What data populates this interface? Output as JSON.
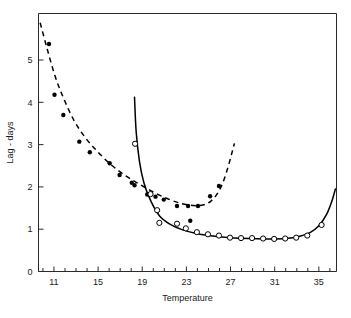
{
  "chart_data": {
    "type": "scatter",
    "title": "",
    "xlabel": "Temperature",
    "ylabel": "Lag - days",
    "xlim": [
      9.6,
      36.6
    ],
    "ylim": [
      0,
      6.1
    ],
    "grid": false,
    "legend": "none",
    "x_ticks_major": [
      11,
      15,
      19,
      23,
      27,
      31,
      35
    ],
    "x_ticks_major_labels": [
      "11",
      "15",
      "19",
      "23",
      "27",
      "31",
      "35"
    ],
    "x_tick_minor_step": 1,
    "y_ticks_major": [
      0,
      1,
      2,
      3,
      4,
      5
    ],
    "y_ticks_major_labels": [
      "0",
      "1",
      "2",
      "3",
      "4",
      "5"
    ],
    "series": [
      {
        "name": "filled-circles",
        "marker": "filled-circle",
        "points": [
          {
            "x": 10.55,
            "y": 5.38
          },
          {
            "x": 11.05,
            "y": 4.18
          },
          {
            "x": 11.85,
            "y": 3.7
          },
          {
            "x": 13.3,
            "y": 3.07
          },
          {
            "x": 14.25,
            "y": 2.82
          },
          {
            "x": 16.05,
            "y": 2.56
          },
          {
            "x": 16.95,
            "y": 2.28
          },
          {
            "x": 18.05,
            "y": 2.1
          },
          {
            "x": 18.3,
            "y": 2.04
          },
          {
            "x": 19.45,
            "y": 1.82
          },
          {
            "x": 20.2,
            "y": 1.77
          },
          {
            "x": 20.95,
            "y": 1.7
          },
          {
            "x": 22.15,
            "y": 1.55
          },
          {
            "x": 23.15,
            "y": 1.55
          },
          {
            "x": 24.05,
            "y": 1.55
          },
          {
            "x": 23.35,
            "y": 1.2
          },
          {
            "x": 25.15,
            "y": 1.78
          },
          {
            "x": 25.95,
            "y": 2.02
          }
        ]
      },
      {
        "name": "open-circles",
        "marker": "open-circle",
        "points": [
          {
            "x": 18.35,
            "y": 3.02
          },
          {
            "x": 19.75,
            "y": 1.83
          },
          {
            "x": 20.35,
            "y": 1.45
          },
          {
            "x": 20.55,
            "y": 1.15
          },
          {
            "x": 22.15,
            "y": 1.13
          },
          {
            "x": 22.95,
            "y": 1.02
          },
          {
            "x": 23.95,
            "y": 0.93
          },
          {
            "x": 24.95,
            "y": 0.88
          },
          {
            "x": 25.95,
            "y": 0.85
          },
          {
            "x": 26.95,
            "y": 0.8
          },
          {
            "x": 27.95,
            "y": 0.79
          },
          {
            "x": 28.95,
            "y": 0.79
          },
          {
            "x": 29.95,
            "y": 0.78
          },
          {
            "x": 30.95,
            "y": 0.77
          },
          {
            "x": 31.95,
            "y": 0.78
          },
          {
            "x": 32.95,
            "y": 0.8
          },
          {
            "x": 33.95,
            "y": 0.85
          },
          {
            "x": 35.25,
            "y": 1.1
          }
        ]
      }
    ],
    "curves": [
      {
        "name": "solid-fitted-curve",
        "style": "solid",
        "points": [
          {
            "x": 18.3,
            "y": 4.12
          },
          {
            "x": 18.45,
            "y": 3.3
          },
          {
            "x": 18.75,
            "y": 2.6
          },
          {
            "x": 19.15,
            "y": 2.1
          },
          {
            "x": 19.75,
            "y": 1.68
          },
          {
            "x": 20.55,
            "y": 1.32
          },
          {
            "x": 21.5,
            "y": 1.12
          },
          {
            "x": 22.6,
            "y": 0.99
          },
          {
            "x": 23.9,
            "y": 0.9
          },
          {
            "x": 25.4,
            "y": 0.84
          },
          {
            "x": 27.0,
            "y": 0.8
          },
          {
            "x": 28.8,
            "y": 0.78
          },
          {
            "x": 30.6,
            "y": 0.77
          },
          {
            "x": 32.0,
            "y": 0.78
          },
          {
            "x": 33.2,
            "y": 0.83
          },
          {
            "x": 34.2,
            "y": 0.92
          },
          {
            "x": 35.0,
            "y": 1.08
          },
          {
            "x": 35.7,
            "y": 1.35
          },
          {
            "x": 36.2,
            "y": 1.68
          },
          {
            "x": 36.5,
            "y": 1.95
          }
        ]
      },
      {
        "name": "dashed-fitted-curve",
        "style": "dashed",
        "points": [
          {
            "x": 9.75,
            "y": 5.88
          },
          {
            "x": 10.4,
            "y": 5.25
          },
          {
            "x": 11.1,
            "y": 4.62
          },
          {
            "x": 11.9,
            "y": 4.08
          },
          {
            "x": 12.8,
            "y": 3.58
          },
          {
            "x": 13.8,
            "y": 3.18
          },
          {
            "x": 14.9,
            "y": 2.85
          },
          {
            "x": 16.1,
            "y": 2.54
          },
          {
            "x": 17.4,
            "y": 2.28
          },
          {
            "x": 18.7,
            "y": 2.07
          },
          {
            "x": 20.0,
            "y": 1.88
          },
          {
            "x": 21.3,
            "y": 1.72
          },
          {
            "x": 22.5,
            "y": 1.61
          },
          {
            "x": 23.6,
            "y": 1.56
          },
          {
            "x": 24.5,
            "y": 1.57
          },
          {
            "x": 25.2,
            "y": 1.66
          },
          {
            "x": 25.8,
            "y": 1.84
          },
          {
            "x": 26.3,
            "y": 2.1
          },
          {
            "x": 26.75,
            "y": 2.45
          },
          {
            "x": 27.1,
            "y": 2.78
          },
          {
            "x": 27.35,
            "y": 3.03
          }
        ]
      }
    ]
  }
}
